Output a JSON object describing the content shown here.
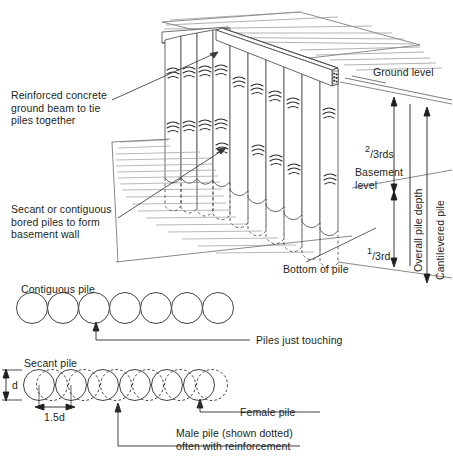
{
  "figure": {
    "title_semantic": "secant-and-contiguous-bored-pile-basement-wall-diagram",
    "ink_color": "#231f20",
    "hatch_color": "#8a8a8a",
    "line_color": "#3f3f3f"
  },
  "callouts": {
    "ground_beam": "Reinforced concrete\nground beam to tie\npiles together",
    "bored_piles": "Secant or contiguous\nbored piles to form\nbasement wall",
    "ground_level": "Ground level",
    "basement_level": "Basement\nlevel",
    "bottom_of_pile": "Bottom of pile"
  },
  "dimensions": {
    "two_thirds": {
      "numerator": "2",
      "denominator": "3rds"
    },
    "one_third": {
      "numerator": "1",
      "denominator": "3rd"
    },
    "overall_pile_depth": "Overall pile depth",
    "cantilevered_pile": "Cantilevered pile"
  },
  "contiguous": {
    "title": "Contiguous pile",
    "note": "Piles just touching",
    "circle_count": 7
  },
  "secant": {
    "title": "Secant pile",
    "diameter_label": "d",
    "spacing_label": "1.5d",
    "female_label": "Female pile",
    "male_label": "Male pile (shown dotted)\noften with reinforcement",
    "female_count": 6,
    "male_count": 6
  }
}
